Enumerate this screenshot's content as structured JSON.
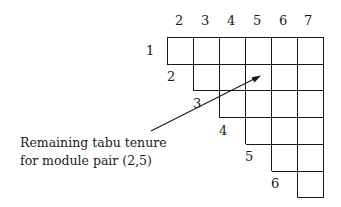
{
  "diagram": {
    "column_labels": [
      "2",
      "3",
      "4",
      "5",
      "6",
      "7"
    ],
    "row_labels": [
      "1",
      "2",
      "3",
      "4",
      "5",
      "6"
    ],
    "annotation": {
      "line1": "Remaining tabu tenure",
      "line2": "for module pair (2,5)"
    },
    "highlighted_pair": [
      2,
      5
    ],
    "line_color": "#1a1a1a"
  }
}
